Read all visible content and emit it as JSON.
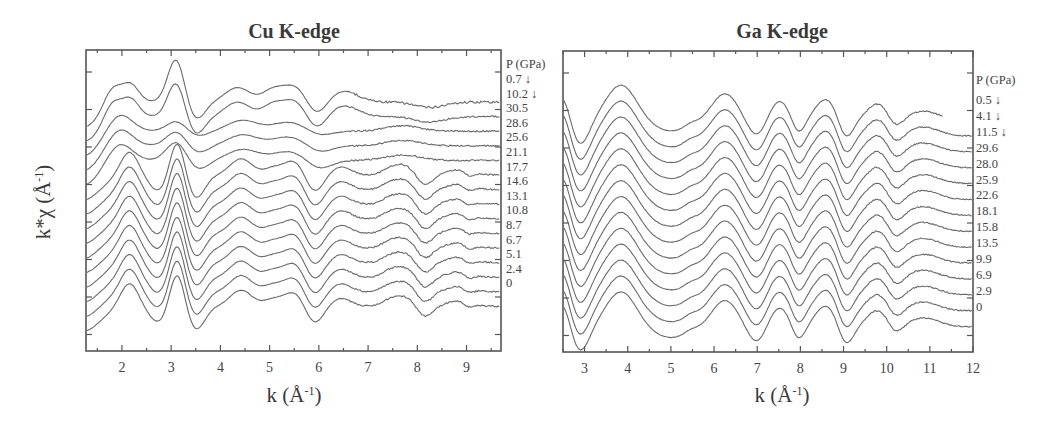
{
  "figure": {
    "ylabel": "k*χ (Å⁻¹)",
    "xlabel": "k (Å⁻¹)"
  },
  "chart_data": [
    {
      "type": "line",
      "title": "Cu K-edge",
      "xlabel": "k (Å⁻¹)",
      "ylabel": "k*χ (Å⁻¹)",
      "xlim": [
        1.27,
        9.7
      ],
      "xticks": [
        2,
        3,
        4,
        5,
        6,
        7,
        8,
        9
      ],
      "grid": false,
      "legend_title": "P (GPa)",
      "legend_position": "right, labels aligned to each stacked curve",
      "note": "Curves are vertically offset (stacked); arrows mark decompression data",
      "series": [
        {
          "name": "0.7 ↓",
          "pressure_GPa": 0.7,
          "decompression": true
        },
        {
          "name": "10.2 ↓",
          "pressure_GPa": 10.2,
          "decompression": true
        },
        {
          "name": "30.5",
          "pressure_GPa": 30.5
        },
        {
          "name": "28.6",
          "pressure_GPa": 28.6
        },
        {
          "name": "25.6",
          "pressure_GPa": 25.6
        },
        {
          "name": "21.1",
          "pressure_GPa": 21.1
        },
        {
          "name": "17.7",
          "pressure_GPa": 17.7
        },
        {
          "name": "14.6",
          "pressure_GPa": 14.6
        },
        {
          "name": "13.1",
          "pressure_GPa": 13.1
        },
        {
          "name": "10.8",
          "pressure_GPa": 10.8
        },
        {
          "name": "8.7",
          "pressure_GPa": 8.7
        },
        {
          "name": "6.7",
          "pressure_GPa": 6.7
        },
        {
          "name": "5.1",
          "pressure_GPa": 5.1
        },
        {
          "name": "2.4",
          "pressure_GPa": 2.4
        },
        {
          "name": "0",
          "pressure_GPa": 0
        }
      ],
      "features": {
        "peaks_k": [
          1.8,
          2.15,
          3.1,
          4.4,
          5.0,
          5.5,
          6.5,
          7.6,
          8.8
        ],
        "minima_k": [
          2.7,
          3.45,
          5.85,
          8.1
        ]
      }
    },
    {
      "type": "line",
      "title": "Ga K-edge",
      "xlabel": "k (Å⁻¹)",
      "ylabel": "k*χ (Å⁻¹)",
      "xlim": [
        2.5,
        12.0
      ],
      "xticks": [
        3,
        4,
        5,
        6,
        7,
        8,
        9,
        10,
        11,
        12
      ],
      "grid": false,
      "legend_title": "P (GPa)",
      "legend_position": "right, labels aligned to each stacked curve",
      "note": "Curves are vertically offset (stacked); arrows mark decompression data",
      "series": [
        {
          "name": "0.5 ↓",
          "pressure_GPa": 0.5,
          "decompression": true
        },
        {
          "name": "4.1 ↓",
          "pressure_GPa": 4.1,
          "decompression": true
        },
        {
          "name": "11.5 ↓",
          "pressure_GPa": 11.5,
          "decompression": true
        },
        {
          "name": "29.6",
          "pressure_GPa": 29.6
        },
        {
          "name": "28.0",
          "pressure_GPa": 28.0
        },
        {
          "name": "25.9",
          "pressure_GPa": 25.9
        },
        {
          "name": "22.6",
          "pressure_GPa": 22.6
        },
        {
          "name": "18.1",
          "pressure_GPa": 18.1
        },
        {
          "name": "15.8",
          "pressure_GPa": 15.8
        },
        {
          "name": "13.5",
          "pressure_GPa": 13.5
        },
        {
          "name": "9.9",
          "pressure_GPa": 9.9
        },
        {
          "name": "6.9",
          "pressure_GPa": 6.9
        },
        {
          "name": "2.9",
          "pressure_GPa": 2.9
        },
        {
          "name": "0",
          "pressure_GPa": 0
        }
      ],
      "features": {
        "peaks_k": [
          3.85,
          6.25,
          7.5,
          8.6,
          9.8,
          10.8
        ],
        "minima_k": [
          2.85,
          5.0,
          7.0,
          7.9,
          9.05,
          10.2
        ]
      }
    }
  ],
  "panels": {
    "cu": {
      "title": "Cu K-edge",
      "legend_title": "P (GPa)",
      "labels": [
        "0.7 ↓",
        "10.2 ↓",
        "30.5",
        "28.6",
        "25.6",
        "21.1",
        "17.7",
        "14.6",
        "13.1",
        "10.8",
        "8.7",
        "6.7",
        "5.1",
        "2.4",
        "0"
      ],
      "xticks": [
        "2",
        "3",
        "4",
        "5",
        "6",
        "7",
        "8",
        "9"
      ],
      "xlabel": "k (Å",
      "xlabel_sup": "-1",
      "xlabel_close": ")"
    },
    "ga": {
      "title": "Ga K-edge",
      "legend_title": "P (GPa)",
      "labels": [
        "0.5 ↓",
        "4.1 ↓",
        "11.5 ↓",
        "29.6",
        "28.0",
        "25.9",
        "22.6",
        "18.1",
        "15.8",
        "13.5",
        "9.9",
        "6.9",
        "2.9",
        "0"
      ],
      "xticks": [
        "3",
        "4",
        "5",
        "6",
        "7",
        "8",
        "9",
        "10",
        "11",
        "12"
      ],
      "xlabel": "k (Å",
      "xlabel_sup": "-1",
      "xlabel_close": ")"
    },
    "ylabel": "k*χ (Å",
    "ylabel_sup": "-1",
    "ylabel_close": ")"
  }
}
